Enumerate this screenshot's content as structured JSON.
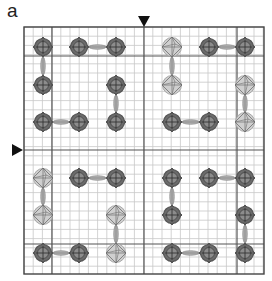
{
  "figure": {
    "panel_label": "a",
    "frame": {
      "x0": 24,
      "y0": 27,
      "x1": 264,
      "y1": 274
    },
    "grid": {
      "minor_step": 9.2,
      "minor_color": "#c8c8c8",
      "major_color": "#555555"
    },
    "major_lines": {
      "vertical": [
        52,
        144,
        237
      ],
      "horizontal": [
        56,
        150,
        244
      ]
    },
    "markers": [
      {
        "type": "arrow-down",
        "x": 144,
        "y": 21,
        "label": "column-marker"
      },
      {
        "type": "arrow-right",
        "x": 17,
        "y": 150,
        "label": "row-marker"
      }
    ],
    "colors": {
      "dark_node": "#6b6b6b",
      "dark_node_ring": "#555555",
      "light_node": "#cfcfcf",
      "light_node_stroke": "#6e6e6e",
      "connector": "#8a8a8a"
    },
    "quadrants": [
      {
        "name": "top-left",
        "xs": [
          43,
          79,
          116
        ],
        "ys": [
          47,
          85,
          122
        ],
        "nodes": [
          [
            "dark",
            "dark",
            "dark"
          ],
          [
            "dark",
            null,
            "dark"
          ],
          [
            "dark",
            "dark",
            "dark"
          ]
        ]
      },
      {
        "name": "top-right",
        "xs": [
          172,
          209,
          245
        ],
        "ys": [
          47,
          85,
          122
        ],
        "nodes": [
          [
            "light",
            "dark",
            "dark"
          ],
          [
            "light",
            null,
            "light"
          ],
          [
            "dark",
            "dark",
            "light"
          ]
        ]
      },
      {
        "name": "bottom-left",
        "xs": [
          43,
          79,
          116
        ],
        "ys": [
          178,
          215,
          253
        ],
        "nodes": [
          [
            "light",
            "dark",
            "dark"
          ],
          [
            "light",
            null,
            "light"
          ],
          [
            "dark",
            "dark",
            "light"
          ]
        ]
      },
      {
        "name": "bottom-right",
        "xs": [
          172,
          209,
          245
        ],
        "ys": [
          178,
          215,
          253
        ],
        "nodes": [
          [
            "dark",
            "dark",
            "dark"
          ],
          [
            "dark",
            null,
            "dark"
          ],
          [
            "dark",
            "dark",
            "dark"
          ]
        ]
      }
    ],
    "connectors": [
      {
        "from": [
          0,
          0
        ],
        "to": [
          0,
          1
        ]
      },
      {
        "from": [
          1,
          0
        ],
        "to": [
          2,
          0
        ]
      },
      {
        "from": [
          2,
          1
        ],
        "to": [
          2,
          2
        ]
      },
      {
        "from": [
          0,
          2
        ],
        "to": [
          1,
          2
        ]
      }
    ]
  }
}
